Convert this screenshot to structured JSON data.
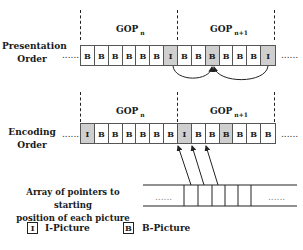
{
  "rows": [
    {
      "label": "Presentation Order",
      "label_lines": [
        "Presentation",
        "Order"
      ],
      "gop_left": {
        "base": "GOP",
        "sub": "n"
      },
      "gop_right": {
        "base": "GOP",
        "sub": "n+1"
      },
      "cells": [
        {
          "t": "B",
          "gray": false
        },
        {
          "t": "B",
          "gray": false
        },
        {
          "t": "B",
          "gray": false
        },
        {
          "t": "B",
          "gray": false
        },
        {
          "t": "B",
          "gray": false
        },
        {
          "t": "B",
          "gray": false
        },
        {
          "t": "I",
          "gray": true
        },
        {
          "t": "B",
          "gray": false
        },
        {
          "t": "B",
          "gray": false
        },
        {
          "t": "B",
          "gray": true
        },
        {
          "t": "B",
          "gray": false
        },
        {
          "t": "B",
          "gray": false
        },
        {
          "t": "B",
          "gray": false
        },
        {
          "t": "I",
          "gray": true
        }
      ],
      "ellipsis_left": "......",
      "ellipsis_right": "......"
    },
    {
      "label": "Encoding Order",
      "label_lines": [
        "Encoding",
        "Order"
      ],
      "gop_left": {
        "base": "GOP",
        "sub": "n"
      },
      "gop_right": {
        "base": "GOP",
        "sub": "n+1"
      },
      "cells": [
        {
          "t": "I",
          "gray": true
        },
        {
          "t": "B",
          "gray": false
        },
        {
          "t": "B",
          "gray": false
        },
        {
          "t": "B",
          "gray": false
        },
        {
          "t": "B",
          "gray": false
        },
        {
          "t": "B",
          "gray": false
        },
        {
          "t": "B",
          "gray": false
        },
        {
          "t": "I",
          "gray": true
        },
        {
          "t": "B",
          "gray": false
        },
        {
          "t": "B",
          "gray": false
        },
        {
          "t": "B",
          "gray": true
        },
        {
          "t": "B",
          "gray": false
        },
        {
          "t": "B",
          "gray": false
        },
        {
          "t": "B",
          "gray": false
        }
      ],
      "ellipsis_left": "......",
      "ellipsis_right": "......"
    }
  ],
  "pointer_array": {
    "label_lines": [
      "Array  of pointers to starting",
      "position of each picture"
    ],
    "ellipsis_left": "......",
    "ellipsis_right": "......"
  },
  "legend": [
    {
      "symbol": "I",
      "label": "I-Picture"
    },
    {
      "symbol": "B",
      "label": "B-Picture"
    }
  ]
}
